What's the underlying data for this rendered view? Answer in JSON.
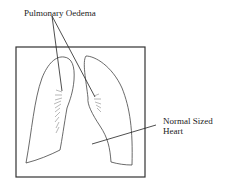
{
  "labels": {
    "oedema": "Pulmonary Oedema",
    "heart_line1": "Normal Sized",
    "heart_line2": "Heart"
  },
  "colors": {
    "stroke": "#333333",
    "hatch": "#888888"
  }
}
